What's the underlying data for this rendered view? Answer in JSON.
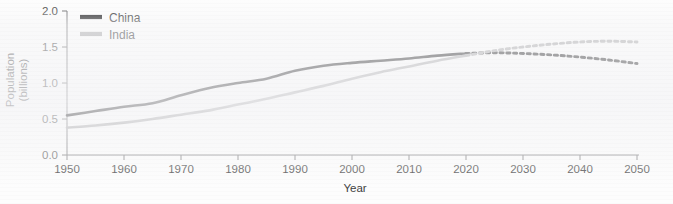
{
  "chart_data": {
    "type": "line",
    "title": "",
    "xlabel": "Year",
    "ylabel": "Population (billions)",
    "ylabel_line1": "Population",
    "ylabel_line2": "(billions)",
    "xlim": [
      1950,
      2050
    ],
    "ylim": [
      0.0,
      2.0
    ],
    "grid": false,
    "legend_position": "top-left",
    "xticks": [
      1950,
      1960,
      1970,
      1980,
      1990,
      2000,
      2010,
      2020,
      2030,
      2040,
      2050
    ],
    "xtick_labels": [
      "1950",
      "1960",
      "1970",
      "1980",
      "1990",
      "2000",
      "2010",
      "2020",
      "2030",
      "2040",
      "2050"
    ],
    "yticks": [
      0.0,
      0.5,
      1.0,
      1.5,
      2.0
    ],
    "ytick_labels": [
      "0.0",
      "0.5",
      "1.0",
      "1.5",
      "2.0"
    ],
    "projection_start_year": 2020,
    "annotations": [
      "Solid segments are historical estimates (1950-2020); dashed segments are projections (2020-2050).",
      "India's projected population overtakes China's shortly after 2020."
    ],
    "series": [
      {
        "name": "China",
        "color": "#1c1c1e",
        "linestyle_historical": "solid",
        "linestyle_projection": "dashed",
        "x": [
          1950,
          1955,
          1960,
          1965,
          1970,
          1975,
          1980,
          1985,
          1990,
          1995,
          2000,
          2005,
          2010,
          2015,
          2020,
          2025,
          2030,
          2035,
          2040,
          2045,
          2050
        ],
        "values": [
          0.55,
          0.61,
          0.67,
          0.72,
          0.83,
          0.93,
          1.0,
          1.06,
          1.17,
          1.24,
          1.28,
          1.31,
          1.34,
          1.38,
          1.41,
          1.42,
          1.41,
          1.39,
          1.36,
          1.32,
          1.27
        ]
      },
      {
        "name": "India",
        "color": "#a8a8aa",
        "linestyle_historical": "solid",
        "linestyle_projection": "dashed",
        "x": [
          1950,
          1955,
          1960,
          1965,
          1970,
          1975,
          1980,
          1985,
          1990,
          1995,
          2000,
          2005,
          2010,
          2015,
          2020,
          2025,
          2030,
          2035,
          2040,
          2045,
          2050
        ],
        "values": [
          0.38,
          0.41,
          0.45,
          0.5,
          0.56,
          0.62,
          0.7,
          0.78,
          0.87,
          0.96,
          1.06,
          1.15,
          1.23,
          1.31,
          1.38,
          1.45,
          1.5,
          1.54,
          1.57,
          1.58,
          1.57
        ]
      }
    ]
  },
  "legend": {
    "items": [
      {
        "label": "China",
        "color": "#1c1c1e"
      },
      {
        "label": "India",
        "color": "#a8a8aa"
      }
    ]
  }
}
